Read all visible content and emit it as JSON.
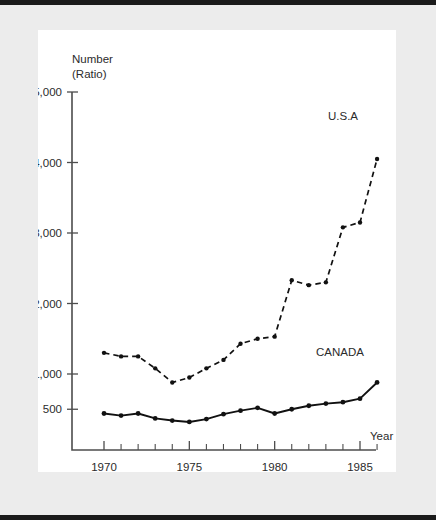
{
  "figure": {
    "y_axis_title_line1": "Number",
    "y_axis_title_line2": "(Ratio)",
    "x_axis_title": "Year"
  },
  "chart_data": {
    "type": "line",
    "title": "",
    "subtitle": "",
    "xlabel": "Year",
    "ylabel": "Number (Ratio)",
    "xlim": [
      1969.4,
      1986.6
    ],
    "ylim": [
      0,
      5000
    ],
    "grid": false,
    "legend_position": "inline-annotation",
    "x_tick_labels": [
      "1970",
      "1975",
      "1980",
      "1985"
    ],
    "x_tick_values": [
      1970,
      1975,
      1980,
      1985
    ],
    "x_minor_ticks": [
      1971,
      1972,
      1973,
      1974,
      1976,
      1977,
      1978,
      1979,
      1981,
      1982,
      1983,
      1984,
      1986
    ],
    "y_tick_labels": [
      "500",
      "1,000",
      "2,000",
      "3,000",
      "4,000",
      "5,000"
    ],
    "y_tick_values": [
      500,
      1000,
      2000,
      3000,
      4000,
      5000
    ],
    "x": [
      1970,
      1971,
      1972,
      1973,
      1974,
      1975,
      1976,
      1977,
      1978,
      1979,
      1980,
      1981,
      1982,
      1983,
      1984,
      1985,
      1986
    ],
    "series": [
      {
        "name": "U.S.A",
        "style": "dashed",
        "label": "U.S.A",
        "values": [
          1300,
          1250,
          1250,
          1080,
          880,
          950,
          1080,
          1200,
          1430,
          1500,
          1530,
          2330,
          2260,
          2300,
          3080,
          3150,
          4050
        ]
      },
      {
        "name": "CANADA",
        "style": "solid",
        "label": "CANADA",
        "values": [
          440,
          410,
          440,
          370,
          340,
          320,
          360,
          430,
          480,
          520,
          440,
          500,
          550,
          580,
          600,
          650,
          880
        ]
      }
    ]
  }
}
